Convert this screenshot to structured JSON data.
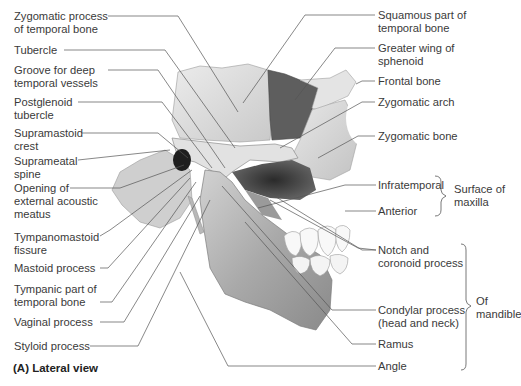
{
  "figure": {
    "caption": "(A) Lateral view",
    "colors": {
      "bone_light": "#e6e6e6",
      "bone_mid": "#bdbdbd",
      "bone_dark": "#6e6e6e",
      "greater_wing": "#5a5a5a",
      "leader_line": "#555555",
      "text": "#3a3a3a"
    }
  },
  "labels_left": [
    {
      "line1": "Zygomatic process",
      "line2": "of temporal bone"
    },
    {
      "line1": "Tubercle",
      "line2": ""
    },
    {
      "line1": "Groove for deep",
      "line2": "temporal vessels"
    },
    {
      "line1": "Postglenoid",
      "line2": "tubercle"
    },
    {
      "line1": "Supramastoid",
      "line2": "crest"
    },
    {
      "line1": "Suprameatal",
      "line2": "spine"
    },
    {
      "line1": "Opening of",
      "line2": "external acoustic",
      "line3": "meatus"
    },
    {
      "line1": "Tympanomastoid",
      "line2": "fissure"
    },
    {
      "line1": "Mastoid process",
      "line2": ""
    },
    {
      "line1": "Tympanic part of",
      "line2": "temporal bone"
    },
    {
      "line1": "Vaginal process",
      "line2": ""
    },
    {
      "line1": "Styloid process",
      "line2": ""
    }
  ],
  "labels_right": [
    {
      "line1": "Squamous part of",
      "line2": "temporal bone"
    },
    {
      "line1": "Greater wing of",
      "line2": "sphenoid"
    },
    {
      "line1": "Frontal bone",
      "line2": ""
    },
    {
      "line1": "Zygomatic arch",
      "line2": ""
    },
    {
      "line1": "Zygomatic bone",
      "line2": ""
    },
    {
      "line1": "Infratemporal",
      "line2": ""
    },
    {
      "line1": "Anterior",
      "line2": ""
    },
    {
      "line1": "Notch and",
      "line2": "coronoid process"
    },
    {
      "line1": "Condylar process",
      "line2": "(head and neck)"
    },
    {
      "line1": "Ramus",
      "line2": ""
    },
    {
      "line1": "Angle",
      "line2": ""
    }
  ],
  "groups": [
    {
      "line1": "Surface of",
      "line2": "maxilla"
    },
    {
      "line1": "Of",
      "line2": "mandible"
    }
  ]
}
